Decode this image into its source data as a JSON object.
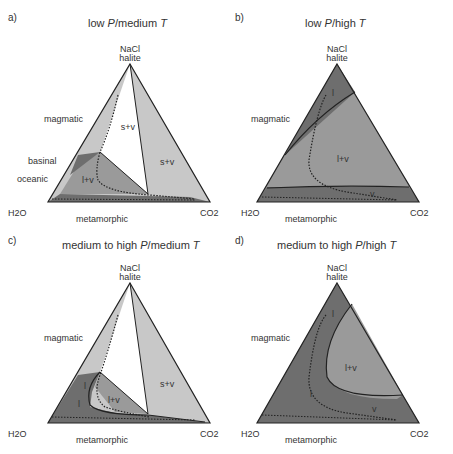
{
  "panels": [
    {
      "id": "a",
      "label": "a)",
      "title_pre": "low ",
      "title_P": "P",
      "title_mid": "/medium ",
      "title_T": "T"
    },
    {
      "id": "b",
      "label": "b)",
      "title_pre": "low ",
      "title_P": "P",
      "title_mid": "/high ",
      "title_T": "T"
    },
    {
      "id": "c",
      "label": "c)",
      "title_pre": "medium to high ",
      "title_P": "P",
      "title_mid": "/medium ",
      "title_T": "T"
    },
    {
      "id": "d",
      "label": "d)",
      "title_pre": "medium to high ",
      "title_P": "P",
      "title_mid": "/high ",
      "title_T": "T"
    }
  ],
  "vertices": {
    "top_1": "NaCl",
    "top_2": "halite",
    "left": "H2O",
    "right": "CO2"
  },
  "labels": {
    "magmatic": "magmatic",
    "basinal": "basinal",
    "oceanic": "oceanic",
    "metamorphic": "metamorphic",
    "s_l": "s + l",
    "s_l_v": "s + l + v",
    "s_v": "s+v",
    "l_v": "l+v",
    "l": "l",
    "v": "v"
  },
  "colors": {
    "dark": "#6e6e6e",
    "mid": "#9a9a9a",
    "light": "#c8c8c8",
    "white": "#ffffff",
    "line": "#222222"
  }
}
